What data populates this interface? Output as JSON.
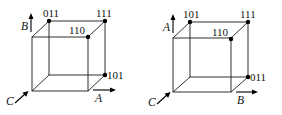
{
  "figure": {
    "colors": {
      "line": "#1a1a1a",
      "dot": "#000000",
      "text": "#111111",
      "background": "#ffffff"
    }
  },
  "cubes": [
    {
      "id": "left",
      "vertex_labels": {
        "back_top_left": "011",
        "back_top_right": "111",
        "front_top_right": "110",
        "back_bottom_right": "101"
      },
      "axes": {
        "vertical": "B",
        "horizontal": "A",
        "depth": "C"
      }
    },
    {
      "id": "right",
      "vertex_labels": {
        "back_top_left": "101",
        "back_top_right": "111",
        "front_top_right": "110",
        "back_bottom_right": "011"
      },
      "axes": {
        "vertical": "A",
        "horizontal": "B",
        "depth": "C"
      }
    }
  ]
}
